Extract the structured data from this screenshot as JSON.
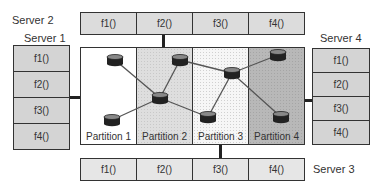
{
  "servers": {
    "server1": {
      "label": "Server 1",
      "functions": [
        "f1()",
        "f2()",
        "f3()",
        "f4()"
      ]
    },
    "server2": {
      "label": "Server 2",
      "functions": [
        "f1()",
        "f2()",
        "f3()",
        "f4()"
      ]
    },
    "server3": {
      "label": "Server 3",
      "functions": [
        "f1()",
        "f2()",
        "f3()",
        "f4()"
      ]
    },
    "server4": {
      "label": "Server 4",
      "functions": [
        "f1()",
        "f2()",
        "f3()",
        "f4()"
      ]
    }
  },
  "partitions": [
    {
      "label": "Partition 1"
    },
    {
      "label": "Partition 2"
    },
    {
      "label": "Partition 3"
    },
    {
      "label": "Partition 4"
    }
  ],
  "routers": [
    {
      "id": "r1",
      "partition": 1,
      "x": 115,
      "y": 60
    },
    {
      "id": "r2",
      "partition": 1,
      "x": 112,
      "y": 120
    },
    {
      "id": "r3",
      "partition": 2,
      "x": 180,
      "y": 60
    },
    {
      "id": "r4",
      "partition": 2,
      "x": 160,
      "y": 98
    },
    {
      "id": "r5",
      "partition": 3,
      "x": 208,
      "y": 117
    },
    {
      "id": "r6",
      "partition": 3,
      "x": 232,
      "y": 73
    },
    {
      "id": "r7",
      "partition": 4,
      "x": 278,
      "y": 55
    },
    {
      "id": "r8",
      "partition": 4,
      "x": 281,
      "y": 117
    }
  ],
  "links": [
    [
      "r1",
      "r4"
    ],
    [
      "r2",
      "r4"
    ],
    [
      "r3",
      "r4"
    ],
    [
      "r4",
      "r5"
    ],
    [
      "r3",
      "r6"
    ],
    [
      "r5",
      "r6"
    ],
    [
      "r6",
      "r7"
    ],
    [
      "r6",
      "r8"
    ]
  ]
}
